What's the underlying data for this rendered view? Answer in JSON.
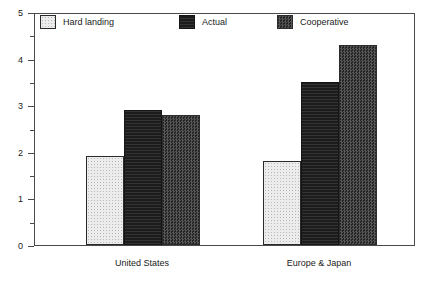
{
  "chart_data": {
    "type": "bar",
    "title": "",
    "xlabel": "",
    "ylabel": "",
    "categories": [
      "United States",
      "Europe & Japan"
    ],
    "series": [
      {
        "name": "Hard landing",
        "values": [
          1.9,
          1.8
        ],
        "fill": "light-dotted",
        "color": "#ececec"
      },
      {
        "name": "Actual",
        "values": [
          2.9,
          3.5
        ],
        "fill": "solid-black",
        "color": "#1c1c1c"
      },
      {
        "name": "Cooperative",
        "values": [
          2.8,
          4.3
        ],
        "fill": "dark-checker",
        "color": "#3a3a3a"
      }
    ],
    "ylim": [
      0,
      5
    ],
    "y_major_ticks": [
      0,
      1,
      2,
      3,
      4,
      5
    ],
    "y_minor_ticks": [
      0.5,
      1.5,
      2.5,
      3.5,
      4.5
    ],
    "y_tick_labels": [
      "0",
      "1",
      "2",
      "3",
      "4",
      "5"
    ],
    "grid": false,
    "legend_position": "top-inside",
    "frame": "box"
  },
  "axis": {
    "y_labels": [
      "5",
      "4",
      "3",
      "2",
      "1",
      "0"
    ]
  },
  "legend": {
    "items": [
      {
        "label": "Hard landing"
      },
      {
        "label": "Actual"
      },
      {
        "label": "Cooperative"
      }
    ]
  },
  "x_axis": {
    "labels": [
      "United States",
      "Europe & Japan"
    ]
  }
}
